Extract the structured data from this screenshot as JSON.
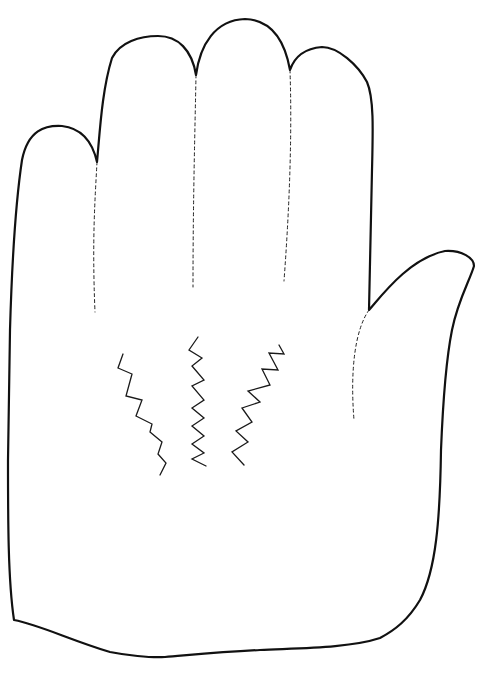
{
  "drawing": {
    "subject": "Hand outline (palm facing, fingers up, thumb on right)",
    "stroke_color": "#111111",
    "background": "#ffffff",
    "outline_path": "M 14 620 C 8 580 8 520 8 460 L 10 330 C 12 260 16 200 22 160 C 28 130 45 125 62 126 C 80 128 92 140 97 162 C 100 130 102 90 112 58 C 120 42 140 36 158 36 C 178 36 192 50 196 75 C 200 45 215 20 245 19 C 272 20 285 42 290 70 C 296 52 310 48 322 47 C 338 47 358 65 367 82 C 374 98 373 130 372 170 L 369 310 C 382 295 410 258 445 251 C 462 250 474 258 474 266 C 470 280 458 300 452 330 C 446 360 443 400 441 450 C 440 520 436 570 420 600 C 408 620 395 630 380 638 C 350 648 300 648 260 650 C 220 652 190 655 165 657 C 150 658 125 655 110 652 C 70 640 40 625 14 620 Z",
    "dashed_lines": [
      {
        "name": "crease-index-pinky",
        "d": "M 97 162 C 95 200 92 240 95 312"
      },
      {
        "name": "crease-middle-index",
        "d": "M 196 75 C 195 130 193 200 193 287"
      },
      {
        "name": "crease-ring-middle",
        "d": "M 290 70 C 292 130 290 200 284 281"
      },
      {
        "name": "crease-thumb",
        "d": "M 369 310 C 355 330 350 370 354 420"
      }
    ],
    "zigzags": [
      {
        "name": "zigzag-left",
        "points": "123,354 118,368 132,374 126,396 142,400 136,416 152,424 150,432 162,442 158,454 166,463 160,475"
      },
      {
        "name": "zigzag-center",
        "points": "198,337 189,350 202,358 192,366 204,380 192,386 204,400 192,408 204,418 192,426 204,436 192,444 204,453 192,459 206,466"
      },
      {
        "name": "zigzag-right",
        "points": "279,345 284,354 269,353 278,370 262,369 270,385 248,391 260,402 242,408 252,422 236,431 248,442 232,452 244,465"
      }
    ]
  }
}
